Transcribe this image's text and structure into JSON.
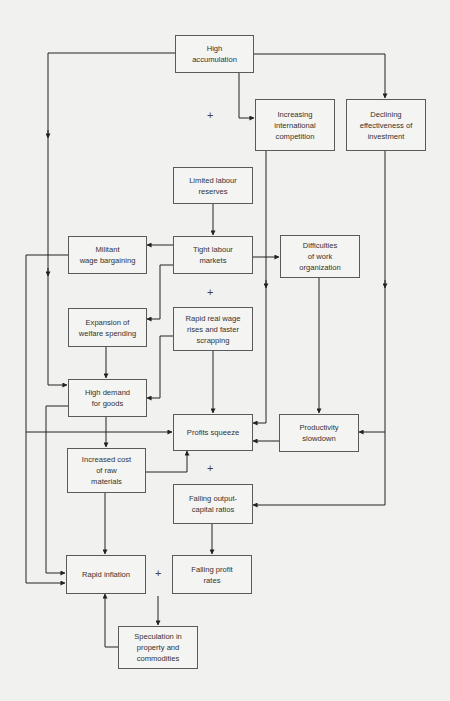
{
  "diagram": {
    "nodes": {
      "high_accumulation": {
        "lines": [
          "High",
          "accumulation"
        ]
      },
      "intl_competition": {
        "lines": [
          "Increasing",
          "international",
          "competition"
        ]
      },
      "declining_investment": {
        "lines": [
          "Declining",
          "effectiveness of",
          "investment"
        ]
      },
      "limited_labour": {
        "lines": [
          "Limited labour",
          "reserves"
        ]
      },
      "militant_wage": {
        "lines": [
          "Militant",
          "wage bargaining"
        ]
      },
      "tight_labour": {
        "lines": [
          "Tight labour",
          "markets"
        ]
      },
      "work_org": {
        "lines": [
          "Difficulties",
          "of work",
          "organization"
        ]
      },
      "welfare": {
        "lines": [
          "Expansion of",
          "welfare spending"
        ]
      },
      "real_wage": {
        "lines": [
          "Rapid real wage",
          "rises and faster",
          "scrapping"
        ]
      },
      "high_demand": {
        "lines": [
          "High demand",
          "for goods"
        ]
      },
      "profits_squeeze": {
        "lines": [
          "Profits squeeze"
        ]
      },
      "productivity": {
        "lines": [
          "Productivity",
          "slowdown"
        ]
      },
      "raw_materials": {
        "lines": [
          "Increased cost",
          "of raw",
          "materials"
        ]
      },
      "output_capital": {
        "lines": [
          "Falling output-",
          "capital ratios"
        ]
      },
      "rapid_inflation": {
        "lines": [
          "Rapid inflation"
        ]
      },
      "falling_profit": {
        "lines": [
          "Falling profit",
          "rates"
        ]
      },
      "speculation": {
        "lines": [
          "Speculation in",
          "property and",
          "commodities"
        ]
      }
    },
    "plus_signs": [
      "+",
      "+",
      "+",
      "+"
    ],
    "colors": {
      "background": "#f1f1ef",
      "box_border": "#5a5a5a",
      "line": "#222222",
      "text": "#333333"
    }
  }
}
